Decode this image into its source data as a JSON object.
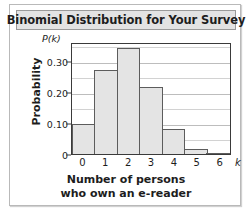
{
  "figure": {
    "title": "Binomial Distribution for Your Survey"
  },
  "chart_data": {
    "type": "bar",
    "title": "Binomial Distribution for Your Survey",
    "xlabel": "Number of persons who own an e-reader",
    "xlabel_lines": [
      "Number of persons",
      "who own an e-reader"
    ],
    "ylabel": "Probability",
    "y_axis_symbol": "P(k)",
    "x_axis_symbol": "k",
    "categories": [
      "0",
      "1",
      "2",
      "3",
      "4",
      "5",
      "6"
    ],
    "values": [
      0.095,
      0.27,
      0.34,
      0.215,
      0.08,
      0.016,
      0.001
    ],
    "xlim": [
      0,
      7
    ],
    "ylim": [
      0,
      0.36
    ],
    "y_ticks": [
      "0",
      "0.10",
      "0.20",
      "0.30"
    ],
    "y_tick_values": [
      0,
      0.1,
      0.2,
      0.3
    ],
    "gridline_values": [
      0.05,
      0.1,
      0.15,
      0.2,
      0.25,
      0.3,
      0.35
    ],
    "grid": true,
    "legend": "none",
    "colors": {
      "bar_fill": "#e4e4e4",
      "bar_edge": "#5c5c5c",
      "axis": "#3a3a3a",
      "gridline": "#d2d2d2",
      "title_bar_bg": "#e3e3e3",
      "title_bar_border": "#9a9a9a",
      "frame_border": "#b9b9b9",
      "text": "#1d1d1d"
    }
  }
}
